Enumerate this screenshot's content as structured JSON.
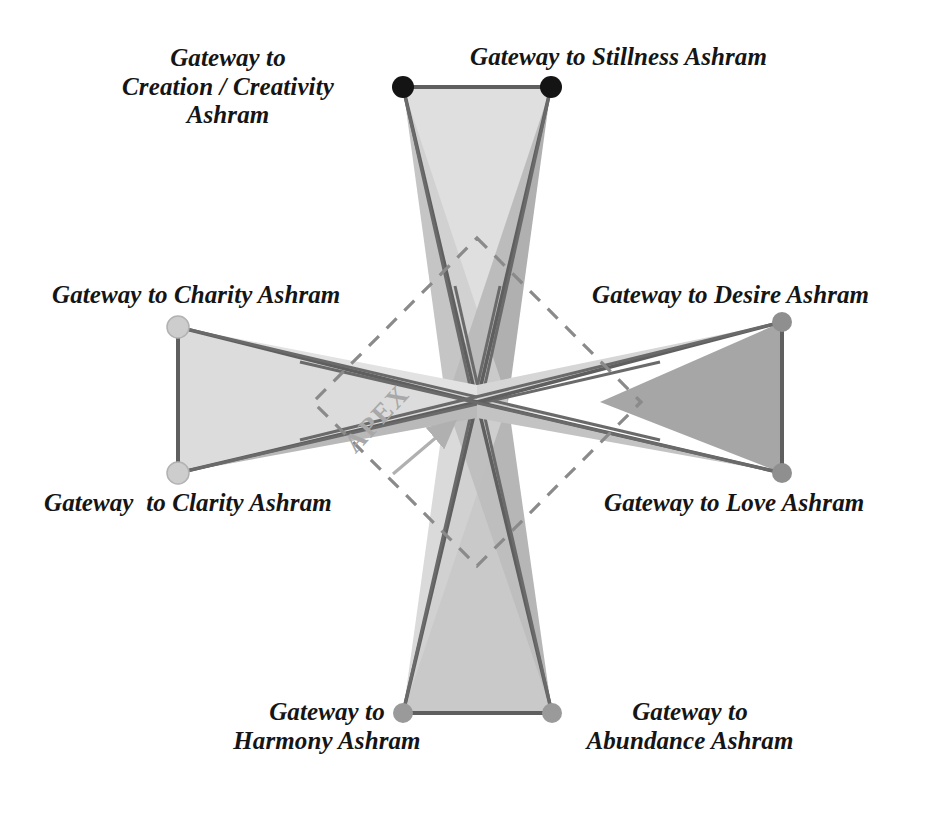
{
  "figure": {
    "background_color": "#ffffff",
    "apex": {
      "label": "APEX",
      "color": "#a8a8a8",
      "arrow": "up-right-arrow",
      "rotation_deg": -47
    },
    "palette": {
      "outline": "#595959",
      "light_fill": "#dcdcdc",
      "mid_fill": "#b4b4b4",
      "dark_fill": "#8e8e8e",
      "dashed_diamond": "#8a8a8a",
      "node_black": "#141414",
      "node_light_gray": "#cdcdcd",
      "node_mid_gray": "#8f8f8f",
      "text": "#151515"
    },
    "center_point": {
      "x": 477,
      "y": 402
    },
    "dashed_diamond": {
      "stroke": "#8a8a8a",
      "dash": "14 11",
      "vertices": [
        {
          "x": 477,
          "y": 238
        },
        {
          "x": 641,
          "y": 402
        },
        {
          "x": 477,
          "y": 566
        },
        {
          "x": 313,
          "y": 402
        }
      ]
    },
    "nodes": [
      {
        "id": "creation",
        "x": 403,
        "y": 87,
        "color": "#141414",
        "radius": 11
      },
      {
        "id": "stillness",
        "x": 551,
        "y": 87,
        "color": "#141414",
        "radius": 11
      },
      {
        "id": "desire",
        "x": 782,
        "y": 322,
        "color": "#8f8f8f",
        "radius": 10
      },
      {
        "id": "love",
        "x": 782,
        "y": 473,
        "color": "#8f8f8f",
        "radius": 10
      },
      {
        "id": "abundance",
        "x": 552,
        "y": 713,
        "color": "#9a9a9a",
        "radius": 10
      },
      {
        "id": "harmony",
        "x": 403,
        "y": 713,
        "color": "#9a9a9a",
        "radius": 10
      },
      {
        "id": "clarity",
        "x": 178,
        "y": 473,
        "color": "#cdcdcd",
        "radius": 11
      },
      {
        "id": "charity",
        "x": 178,
        "y": 327,
        "color": "#cdcdcd",
        "radius": 11
      }
    ],
    "labels": [
      {
        "id": "creation",
        "text": "Gateway to\nCreation / Creativity\nAshram",
        "lines": [
          "Gateway to",
          "Creation / Creativity",
          "Ashram"
        ]
      },
      {
        "id": "stillness",
        "text": "Gateway to Stillness Ashram",
        "lines": [
          "Gateway to Stillness Ashram"
        ]
      },
      {
        "id": "charity",
        "text": "Gateway to Charity Ashram",
        "lines": [
          "Gateway to Charity Ashram"
        ]
      },
      {
        "id": "desire",
        "text": "Gateway to Desire Ashram",
        "lines": [
          "Gateway to Desire Ashram"
        ]
      },
      {
        "id": "clarity",
        "text": "Gateway  to Clarity Ashram",
        "lines": [
          "Gateway  to Clarity Ashram"
        ]
      },
      {
        "id": "love",
        "text": "Gateway to Love Ashram",
        "lines": [
          "Gateway to Love Ashram"
        ]
      },
      {
        "id": "harmony",
        "text": "Gateway to\nHarmony Ashram",
        "lines": [
          "Gateway to",
          "Harmony Ashram"
        ]
      },
      {
        "id": "abundance",
        "text": "Gateway to\nAbundance Ashram",
        "lines": [
          "Gateway to",
          "Abundance Ashram"
        ]
      }
    ]
  }
}
